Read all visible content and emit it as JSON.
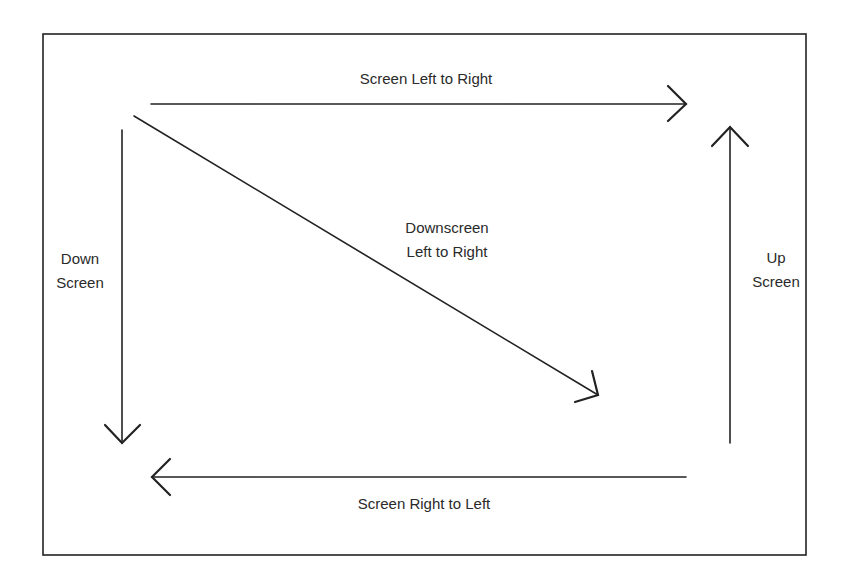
{
  "diagram": {
    "type": "screen-direction-diagram",
    "labels": {
      "top": "Screen Left to Right",
      "diagonal_line1": "Downscreen",
      "diagonal_line2": "Left to Right",
      "left_line1": "Down",
      "left_line2": "Screen",
      "right_line1": "Up",
      "right_line2": "Screen",
      "bottom": "Screen Right to Left"
    },
    "arrows": [
      {
        "name": "screen-left-to-right",
        "from": [
          151,
          104
        ],
        "to": [
          686,
          104
        ]
      },
      {
        "name": "downscreen-left-to-right",
        "from": [
          134,
          116
        ],
        "to": [
          598,
          395
        ]
      },
      {
        "name": "down-screen",
        "from": [
          122,
          130
        ],
        "to": [
          122,
          443
        ]
      },
      {
        "name": "up-screen",
        "from": [
          730,
          443
        ],
        "to": [
          730,
          127
        ]
      },
      {
        "name": "screen-right-to-left",
        "from": [
          686,
          477
        ],
        "to": [
          152,
          477
        ]
      }
    ],
    "colors": {
      "stroke": "#222222",
      "background": "#ffffff"
    }
  }
}
